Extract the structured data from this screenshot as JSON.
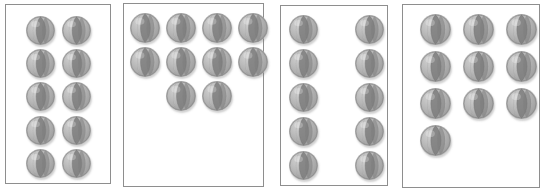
{
  "scene": {
    "title": "Four boxes each containing ten balls in different arrangements",
    "description": "Counting / number conservation comparison task",
    "canvas": {
      "width": 547,
      "height": 192
    },
    "background_color": "#ffffff",
    "panel_border_color": "#8e8e8e",
    "panel_fill_color": "#ffffff",
    "ball_base_color": "#b2b2b2",
    "ball_segment_color": "#7d7d7d",
    "ball_highlight_color": "#d2d2d2",
    "ball_outline_color": "#8a8a8a",
    "ball_shadow_color": "#9a9a9a",
    "object_name": "beach-ball",
    "total_panels": 4,
    "balls_per_panel": 10
  },
  "panels": [
    {
      "id": "panel-1",
      "label": "Box 1",
      "count": 10,
      "arrangement": "2 columns x 5 rows",
      "rows": [
        2,
        2,
        2,
        2,
        2
      ],
      "box": {
        "x": 5,
        "y": 4,
        "width": 106,
        "height": 180
      },
      "ball_size": 29,
      "balls": [
        {
          "x": 26,
          "y": 16
        },
        {
          "x": 62,
          "y": 16
        },
        {
          "x": 26,
          "y": 49
        },
        {
          "x": 62,
          "y": 49
        },
        {
          "x": 26,
          "y": 82
        },
        {
          "x": 62,
          "y": 82
        },
        {
          "x": 26,
          "y": 116
        },
        {
          "x": 62,
          "y": 116
        },
        {
          "x": 26,
          "y": 149
        },
        {
          "x": 62,
          "y": 149
        }
      ]
    },
    {
      "id": "panel-2",
      "label": "Box 2",
      "count": 10,
      "arrangement": "4 + 4 + 2 rows clustered at top",
      "rows": [
        4,
        4,
        2
      ],
      "box": {
        "x": 123,
        "y": 3,
        "width": 141,
        "height": 184
      },
      "ball_size": 30,
      "balls": [
        {
          "x": 130,
          "y": 13
        },
        {
          "x": 166,
          "y": 13
        },
        {
          "x": 202,
          "y": 13
        },
        {
          "x": 238,
          "y": 13
        },
        {
          "x": 130,
          "y": 47
        },
        {
          "x": 166,
          "y": 47
        },
        {
          "x": 202,
          "y": 47
        },
        {
          "x": 238,
          "y": 47
        },
        {
          "x": 166,
          "y": 81
        },
        {
          "x": 202,
          "y": 81
        }
      ]
    },
    {
      "id": "panel-3",
      "label": "Box 3",
      "count": 10,
      "arrangement": "2 widely-spaced columns x 5 rows",
      "rows": [
        2,
        2,
        2,
        2,
        2
      ],
      "box": {
        "x": 280,
        "y": 5,
        "width": 108,
        "height": 181
      },
      "ball_size": 29,
      "balls": [
        {
          "x": 289,
          "y": 15
        },
        {
          "x": 355,
          "y": 15
        },
        {
          "x": 289,
          "y": 49
        },
        {
          "x": 355,
          "y": 49
        },
        {
          "x": 289,
          "y": 83
        },
        {
          "x": 355,
          "y": 83
        },
        {
          "x": 289,
          "y": 117
        },
        {
          "x": 355,
          "y": 117
        },
        {
          "x": 289,
          "y": 151
        },
        {
          "x": 355,
          "y": 151
        }
      ]
    },
    {
      "id": "panel-4",
      "label": "Box 4",
      "count": 10,
      "arrangement": "3 + 3 + 3 + 1 rows clustered at top",
      "rows": [
        3,
        3,
        3,
        1
      ],
      "box": {
        "x": 402,
        "y": 4,
        "width": 138,
        "height": 184
      },
      "ball_size": 31,
      "balls": [
        {
          "x": 420,
          "y": 14
        },
        {
          "x": 463,
          "y": 14
        },
        {
          "x": 506,
          "y": 14
        },
        {
          "x": 420,
          "y": 51
        },
        {
          "x": 463,
          "y": 51
        },
        {
          "x": 506,
          "y": 51
        },
        {
          "x": 420,
          "y": 88
        },
        {
          "x": 463,
          "y": 88
        },
        {
          "x": 506,
          "y": 88
        },
        {
          "x": 420,
          "y": 125
        }
      ]
    }
  ]
}
